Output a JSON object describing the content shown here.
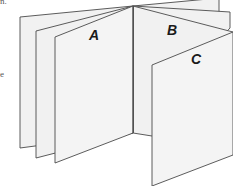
{
  "figure": {
    "type": "book-pages-diagram",
    "labels": {
      "a": "A",
      "b": "B",
      "c": "C"
    },
    "colors": {
      "page_fill": "#f1f1f1",
      "outline": "#4a4a4a",
      "label": "#1a1a1a",
      "background": "#ffffff"
    }
  },
  "cropped_text": {
    "top_left": "n.",
    "left_mid": "e"
  }
}
